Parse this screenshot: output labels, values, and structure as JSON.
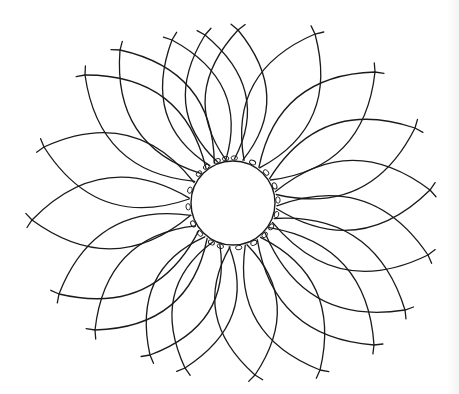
{
  "figure": {
    "title": "Flower line drawing",
    "stroke_color": "#1a1a1a",
    "background_color": "#ffffff",
    "center": {
      "x": 233,
      "y": 203,
      "radius": 42
    },
    "petal_count": 20,
    "petal_tips": [
      {
        "x": 238,
        "y": 30
      },
      {
        "x": 315,
        "y": 34
      },
      {
        "x": 375,
        "y": 72
      },
      {
        "x": 415,
        "y": 128
      },
      {
        "x": 430,
        "y": 190
      },
      {
        "x": 428,
        "y": 255
      },
      {
        "x": 405,
        "y": 310
      },
      {
        "x": 374,
        "y": 345
      },
      {
        "x": 320,
        "y": 370
      },
      {
        "x": 255,
        "y": 375
      },
      {
        "x": 185,
        "y": 368
      },
      {
        "x": 150,
        "y": 355
      },
      {
        "x": 95,
        "y": 330
      },
      {
        "x": 59,
        "y": 294
      },
      {
        "x": 32,
        "y": 220
      },
      {
        "x": 44,
        "y": 147
      },
      {
        "x": 85,
        "y": 75
      },
      {
        "x": 120,
        "y": 50
      },
      {
        "x": 172,
        "y": 40
      },
      {
        "x": 205,
        "y": 35
      }
    ]
  }
}
